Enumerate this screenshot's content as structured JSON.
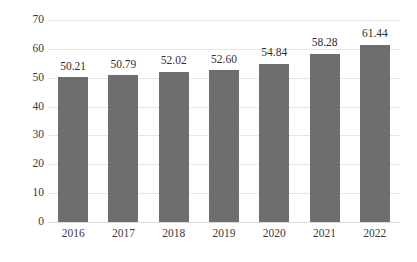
{
  "chart_data": {
    "type": "bar",
    "title": "",
    "subtitle": "",
    "xlabel": "",
    "ylabel": "",
    "categories": [
      "2016",
      "2017",
      "2018",
      "2019",
      "2020",
      "2021",
      "2022"
    ],
    "values": [
      50.21,
      50.79,
      52.02,
      52.6,
      54.84,
      58.28,
      61.44
    ],
    "data_labels": [
      "50.21",
      "50.79",
      "52.02",
      "52.60",
      "54.84",
      "58.28",
      "61.44"
    ],
    "ylim": [
      0,
      70
    ],
    "ytick_step": 10,
    "ytick_labels": [
      "0",
      "10",
      "20",
      "30",
      "40",
      "50",
      "60",
      "70"
    ],
    "grid": true,
    "grid_axis": "y",
    "legend": false,
    "legend_position": "none",
    "series": [
      {
        "name": "",
        "values": [
          50.21,
          50.79,
          52.02,
          52.6,
          54.84,
          58.28,
          61.44
        ]
      }
    ]
  },
  "colors": {
    "bar": "#6e6e6e",
    "gridline": "#e6e6e6",
    "baseline": "#dcdcdc",
    "background": "#ffffff",
    "tick_text": "#3a3a3a",
    "label_text": "#2f2f2f"
  }
}
